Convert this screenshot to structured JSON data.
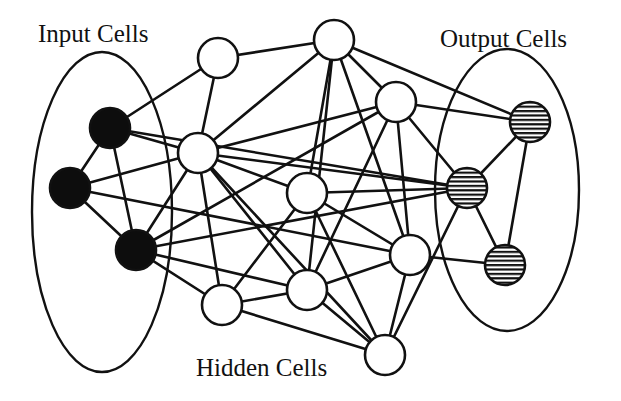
{
  "diagram": {
    "labels": {
      "input": "Input Cells",
      "output": "Output Cells",
      "hidden": "Hidden Cells"
    },
    "colors": {
      "stroke": "#111111",
      "input_fill": "#0d0d0d",
      "hidden_fill": "#ffffff",
      "output_fill": "horizontal-stripes"
    },
    "groups": [
      {
        "id": "input-group",
        "cx": 102,
        "cy": 212,
        "rx": 70,
        "ry": 160
      },
      {
        "id": "output-group",
        "cx": 507,
        "cy": 190,
        "rx": 72,
        "ry": 141
      }
    ],
    "nodes": [
      {
        "id": "I1",
        "type": "input",
        "x": 110,
        "y": 128,
        "r": 20
      },
      {
        "id": "I2",
        "type": "input",
        "x": 70,
        "y": 188,
        "r": 20
      },
      {
        "id": "I3",
        "type": "input",
        "x": 136,
        "y": 250,
        "r": 20
      },
      {
        "id": "H1",
        "type": "hidden",
        "x": 218,
        "y": 58,
        "r": 20
      },
      {
        "id": "H2",
        "type": "hidden",
        "x": 334,
        "y": 40,
        "r": 20
      },
      {
        "id": "H3",
        "type": "hidden",
        "x": 396,
        "y": 102,
        "r": 20
      },
      {
        "id": "H4",
        "type": "hidden",
        "x": 198,
        "y": 153,
        "r": 20
      },
      {
        "id": "H5",
        "type": "hidden",
        "x": 307,
        "y": 193,
        "r": 20
      },
      {
        "id": "H6",
        "type": "hidden",
        "x": 410,
        "y": 255,
        "r": 20
      },
      {
        "id": "H7",
        "type": "hidden",
        "x": 222,
        "y": 305,
        "r": 20
      },
      {
        "id": "H8",
        "type": "hidden",
        "x": 307,
        "y": 290,
        "r": 20
      },
      {
        "id": "H9",
        "type": "hidden",
        "x": 385,
        "y": 355,
        "r": 20
      },
      {
        "id": "O1",
        "type": "output",
        "x": 530,
        "y": 122,
        "r": 20
      },
      {
        "id": "O2",
        "type": "output",
        "x": 467,
        "y": 188,
        "r": 20
      },
      {
        "id": "O3",
        "type": "output",
        "x": 505,
        "y": 265,
        "r": 20
      }
    ],
    "edges": [
      [
        "I1",
        "I2"
      ],
      [
        "I2",
        "I3"
      ],
      [
        "I1",
        "I3"
      ],
      [
        "I1",
        "H1"
      ],
      [
        "I1",
        "H4"
      ],
      [
        "I1",
        "O2"
      ],
      [
        "I2",
        "H4"
      ],
      [
        "I2",
        "H6"
      ],
      [
        "I3",
        "H4"
      ],
      [
        "I3",
        "H3"
      ],
      [
        "I3",
        "H7"
      ],
      [
        "I3",
        "H8"
      ],
      [
        "I3",
        "O2"
      ],
      [
        "H1",
        "H2"
      ],
      [
        "H1",
        "H4"
      ],
      [
        "H2",
        "H3"
      ],
      [
        "H2",
        "H4"
      ],
      [
        "H2",
        "H8"
      ],
      [
        "H2",
        "H6"
      ],
      [
        "H2",
        "O1"
      ],
      [
        "H3",
        "O1"
      ],
      [
        "H3",
        "O2"
      ],
      [
        "H3",
        "H8"
      ],
      [
        "H3",
        "H4"
      ],
      [
        "H4",
        "H5"
      ],
      [
        "H4",
        "O2"
      ],
      [
        "H4",
        "H7"
      ],
      [
        "H4",
        "H8"
      ],
      [
        "H4",
        "H9"
      ],
      [
        "H5",
        "O2"
      ],
      [
        "H5",
        "H7"
      ],
      [
        "H5",
        "H6"
      ],
      [
        "H5",
        "H9"
      ],
      [
        "H5",
        "H2"
      ],
      [
        "H6",
        "H8"
      ],
      [
        "H6",
        "H9"
      ],
      [
        "H6",
        "O3"
      ],
      [
        "H6",
        "H3"
      ],
      [
        "H7",
        "H8"
      ],
      [
        "H7",
        "H9"
      ],
      [
        "H8",
        "H9"
      ],
      [
        "H9",
        "O2"
      ],
      [
        "O1",
        "O2"
      ],
      [
        "O1",
        "O3"
      ],
      [
        "O2",
        "O3"
      ]
    ]
  }
}
